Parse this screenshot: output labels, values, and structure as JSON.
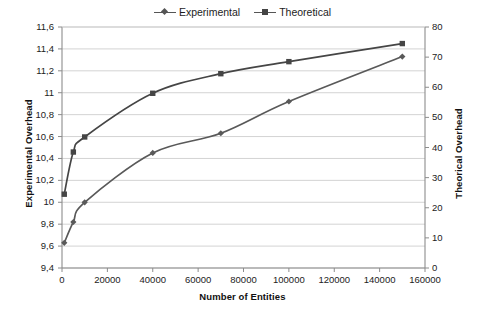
{
  "chart_data": {
    "type": "line",
    "title": "",
    "xlabel": "Number of Entities",
    "ylabel": "Experimental Overhead",
    "y2label": "Theorical Overhead",
    "xlim": [
      0,
      160000
    ],
    "ylim": [
      9.4,
      11.6
    ],
    "y2lim": [
      0,
      80
    ],
    "grid": true,
    "legend_position": "top-center",
    "xticks": [
      "0",
      "20000",
      "40000",
      "60000",
      "80000",
      "100000",
      "120000",
      "140000",
      "160000"
    ],
    "xtick_values": [
      0,
      20000,
      40000,
      60000,
      80000,
      100000,
      120000,
      140000,
      160000
    ],
    "yticks": [
      "9,4",
      "9,6",
      "9,8",
      "10",
      "10,2",
      "10,4",
      "10,6",
      "10,8",
      "11",
      "11,2",
      "11,4",
      "11,6"
    ],
    "ytick_values": [
      9.4,
      9.6,
      9.8,
      10.0,
      10.2,
      10.4,
      10.6,
      10.8,
      11.0,
      11.2,
      11.4,
      11.6
    ],
    "y2ticks": [
      "0",
      "10",
      "20",
      "30",
      "40",
      "50",
      "60",
      "70",
      "80"
    ],
    "y2tick_values": [
      0,
      10,
      20,
      30,
      40,
      50,
      60,
      70,
      80
    ],
    "series": [
      {
        "name": "Experimental",
        "axis": "left",
        "marker": "diamond",
        "color": "#595959",
        "x": [
          1000,
          5000,
          10000,
          40000,
          70000,
          100000,
          150000
        ],
        "values": [
          9.63,
          9.82,
          10.0,
          10.45,
          10.63,
          10.92,
          11.33
        ]
      },
      {
        "name": "Theoretical",
        "axis": "right",
        "marker": "square",
        "color": "#454545",
        "x": [
          1000,
          5000,
          10000,
          40000,
          70000,
          100000,
          150000
        ],
        "values": [
          24.5,
          38.5,
          43.5,
          58.0,
          64.5,
          68.5,
          74.5
        ]
      }
    ]
  },
  "legend": {
    "entries": [
      {
        "label": "Experimental"
      },
      {
        "label": "Theoretical"
      }
    ]
  },
  "axes": {
    "x_title": "Number of Entities",
    "y_left_title": "Experimental Overhead",
    "y_right_title": "Theorical Overhead"
  },
  "colors": {
    "experimental": "#595959",
    "theoretical": "#454545",
    "grid": "#c8c8c8",
    "axis": "#8c8c8c",
    "text": "#1a1a1a",
    "background": "#ffffff"
  }
}
